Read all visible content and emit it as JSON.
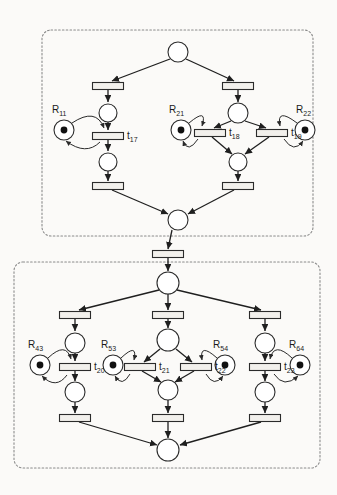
{
  "diagram": {
    "type": "petri-net",
    "title": "",
    "canvas": {
      "width": 337,
      "height": 495
    },
    "colors": {
      "background": "#fbfaf8",
      "stroke": "#1f1f1f",
      "place_fill": "#ffffff",
      "transition_fill": "#f2f0ec",
      "token": "#111111",
      "box_border": "#8a8a8a"
    },
    "subnets": [
      {
        "id": "subnet-top",
        "border_style": "dashed",
        "x": 42,
        "y": 30,
        "width": 271,
        "height": 206
      },
      {
        "id": "subnet-bottom",
        "border_style": "dashed",
        "x": 14,
        "y": 262,
        "width": 306,
        "height": 206
      }
    ],
    "places": [
      {
        "id": "p-top-source",
        "cx": 178,
        "cy": 52,
        "r": 10,
        "tokens": 0,
        "label": ""
      },
      {
        "id": "p-top-left-a",
        "cx": 108,
        "cy": 113,
        "r": 9,
        "tokens": 0,
        "label": ""
      },
      {
        "id": "p-top-left-b",
        "cx": 108,
        "cy": 162,
        "r": 9,
        "tokens": 0,
        "label": ""
      },
      {
        "id": "p-top-mid-a",
        "cx": 238,
        "cy": 113,
        "r": 10,
        "tokens": 0,
        "label": ""
      },
      {
        "id": "p-top-mid-b",
        "cx": 238,
        "cy": 162,
        "r": 9,
        "tokens": 0,
        "label": ""
      },
      {
        "id": "p-top-sink",
        "cx": 178,
        "cy": 220,
        "r": 10,
        "tokens": 0,
        "label": ""
      },
      {
        "id": "p-res-R11",
        "cx": 64,
        "cy": 130,
        "r": 10,
        "tokens": 1,
        "label": "R11"
      },
      {
        "id": "p-res-R21",
        "cx": 181,
        "cy": 130,
        "r": 10,
        "tokens": 1,
        "label": "R21"
      },
      {
        "id": "p-res-R22",
        "cx": 305,
        "cy": 130,
        "r": 10,
        "tokens": 1,
        "label": "R22"
      },
      {
        "id": "p-bot-source",
        "cx": 168,
        "cy": 283,
        "r": 11,
        "tokens": 0,
        "label": ""
      },
      {
        "id": "p-bot-left-a",
        "cx": 75,
        "cy": 343,
        "r": 10,
        "tokens": 0,
        "label": ""
      },
      {
        "id": "p-bot-left-b",
        "cx": 75,
        "cy": 392,
        "r": 10,
        "tokens": 0,
        "label": ""
      },
      {
        "id": "p-bot-mid-a",
        "cx": 168,
        "cy": 340,
        "r": 11,
        "tokens": 0,
        "label": ""
      },
      {
        "id": "p-bot-mid-b",
        "cx": 168,
        "cy": 390,
        "r": 10,
        "tokens": 0,
        "label": ""
      },
      {
        "id": "p-bot-right-a",
        "cx": 265,
        "cy": 343,
        "r": 10,
        "tokens": 0,
        "label": ""
      },
      {
        "id": "p-bot-right-b",
        "cx": 265,
        "cy": 392,
        "r": 10,
        "tokens": 0,
        "label": ""
      },
      {
        "id": "p-bot-sink",
        "cx": 168,
        "cy": 450,
        "r": 11,
        "tokens": 0,
        "label": ""
      },
      {
        "id": "p-res-R43",
        "cx": 40,
        "cy": 365,
        "r": 10,
        "tokens": 1,
        "label": "R43"
      },
      {
        "id": "p-res-R53",
        "cx": 113,
        "cy": 365,
        "r": 10,
        "tokens": 1,
        "label": "R53"
      },
      {
        "id": "p-res-R54",
        "cx": 225,
        "cy": 365,
        "r": 10,
        "tokens": 1,
        "label": "R54"
      },
      {
        "id": "p-res-R64",
        "cx": 300,
        "cy": 365,
        "r": 10,
        "tokens": 1,
        "label": "R64"
      }
    ],
    "transitions": [
      {
        "id": "t-top-l1",
        "cx": 108,
        "cy": 86,
        "w": 31,
        "h": 7,
        "label": ""
      },
      {
        "id": "t17",
        "cx": 108,
        "cy": 136,
        "w": 31,
        "h": 7,
        "label": "t17"
      },
      {
        "id": "t-top-l2",
        "cx": 108,
        "cy": 186,
        "w": 31,
        "h": 7,
        "label": ""
      },
      {
        "id": "t-top-r1",
        "cx": 238,
        "cy": 86,
        "w": 31,
        "h": 7,
        "label": ""
      },
      {
        "id": "t18",
        "cx": 210,
        "cy": 133,
        "w": 31,
        "h": 7,
        "label": "t18"
      },
      {
        "id": "t19",
        "cx": 272,
        "cy": 133,
        "w": 31,
        "h": 7,
        "label": "t19"
      },
      {
        "id": "t-top-r2",
        "cx": 238,
        "cy": 186,
        "w": 31,
        "h": 7,
        "label": ""
      },
      {
        "id": "t-link",
        "cx": 168,
        "cy": 254,
        "w": 31,
        "h": 7,
        "label": ""
      },
      {
        "id": "t-bot-l1",
        "cx": 75,
        "cy": 315,
        "w": 31,
        "h": 7,
        "label": ""
      },
      {
        "id": "t20",
        "cx": 75,
        "cy": 367,
        "w": 31,
        "h": 7,
        "label": "t20"
      },
      {
        "id": "t-bot-l2",
        "cx": 75,
        "cy": 418,
        "w": 31,
        "h": 7,
        "label": ""
      },
      {
        "id": "t-bot-m1",
        "cx": 168,
        "cy": 315,
        "w": 31,
        "h": 7,
        "label": ""
      },
      {
        "id": "t21",
        "cx": 140,
        "cy": 367,
        "w": 31,
        "h": 7,
        "label": "t21"
      },
      {
        "id": "t22",
        "cx": 196,
        "cy": 367,
        "w": 31,
        "h": 7,
        "label": "t22"
      },
      {
        "id": "t-bot-m2",
        "cx": 168,
        "cy": 418,
        "w": 31,
        "h": 7,
        "label": ""
      },
      {
        "id": "t-bot-r1",
        "cx": 265,
        "cy": 315,
        "w": 31,
        "h": 7,
        "label": ""
      },
      {
        "id": "t23",
        "cx": 265,
        "cy": 367,
        "w": 31,
        "h": 7,
        "label": "t23"
      },
      {
        "id": "t-bot-r2",
        "cx": 265,
        "cy": 418,
        "w": 31,
        "h": 7,
        "label": ""
      }
    ],
    "labels": [
      {
        "id": "label-R11",
        "base": "R",
        "sub": "11",
        "x": 52,
        "y": 113
      },
      {
        "id": "label-R21",
        "base": "R",
        "sub": "21",
        "x": 169,
        "y": 113
      },
      {
        "id": "label-R22",
        "base": "R",
        "sub": "22",
        "x": 296,
        "y": 113
      },
      {
        "id": "label-t17",
        "base": "t",
        "sub": "17",
        "x": 127,
        "y": 139
      },
      {
        "id": "label-t18",
        "base": "t",
        "sub": "18",
        "x": 229,
        "y": 136
      },
      {
        "id": "label-t19",
        "base": "t",
        "sub": "19",
        "x": 291,
        "y": 136
      },
      {
        "id": "label-R43",
        "base": "R",
        "sub": "43",
        "x": 28,
        "y": 348
      },
      {
        "id": "label-R53",
        "base": "R",
        "sub": "53",
        "x": 101,
        "y": 348
      },
      {
        "id": "label-R54",
        "base": "R",
        "sub": "54",
        "x": 213,
        "y": 348
      },
      {
        "id": "label-R64",
        "base": "R",
        "sub": "64",
        "x": 289,
        "y": 348
      },
      {
        "id": "label-t20",
        "base": "t",
        "sub": "20",
        "x": 94,
        "y": 370
      },
      {
        "id": "label-t21",
        "base": "t",
        "sub": "21",
        "x": 159,
        "y": 370
      },
      {
        "id": "label-t22",
        "base": "t",
        "sub": "22",
        "x": 215,
        "y": 370
      },
      {
        "id": "label-t23",
        "base": "t",
        "sub": "23",
        "x": 284,
        "y": 370
      }
    ],
    "arcs": [
      {
        "id": "arc-src-to-tl1",
        "from": "p-top-source",
        "to": "t-top-l1",
        "path": "M 170 59 L 112 81"
      },
      {
        "id": "arc-src-to-tr1",
        "from": "p-top-source",
        "to": "t-top-r1",
        "path": "M 186 59 L 234 81"
      },
      {
        "id": "arc-tl1-to-pla",
        "from": "t-top-l1",
        "to": "p-top-left-a",
        "path": "M 108 90 L 108 102"
      },
      {
        "id": "arc-pla-to-t17",
        "from": "p-top-left-a",
        "to": "t17",
        "path": "M 108 122 L 108 130"
      },
      {
        "id": "arc-t17-to-plb",
        "from": "t17",
        "to": "p-top-left-b",
        "path": "M 108 140 L 108 151"
      },
      {
        "id": "arc-plb-to-tl2",
        "from": "p-top-left-b",
        "to": "t-top-l2",
        "path": "M 108 171 L 108 181"
      },
      {
        "id": "arc-tl2-to-sink",
        "from": "t-top-l2",
        "to": "p-top-sink",
        "path": "M 112 190 L 168 214"
      },
      {
        "id": "arc-tr1-to-pma",
        "from": "t-top-r1",
        "to": "p-top-mid-a",
        "path": "M 238 90 L 238 102"
      },
      {
        "id": "arc-pma-to-t18",
        "from": "p-top-mid-a",
        "to": "t18",
        "path": "M 231 121 L 214 128"
      },
      {
        "id": "arc-pma-to-t19",
        "from": "p-top-mid-a",
        "to": "t19",
        "path": "M 245 121 L 266 128"
      },
      {
        "id": "arc-t18-to-pmb",
        "from": "t18",
        "to": "p-top-mid-b",
        "path": "M 212 137 L 232 154"
      },
      {
        "id": "arc-t19-to-pmb",
        "from": "t19",
        "to": "p-top-mid-b",
        "path": "M 269 137 L 245 154"
      },
      {
        "id": "arc-pmb-to-tr2",
        "from": "p-top-mid-b",
        "to": "t-top-r2",
        "path": "M 238 171 L 238 181"
      },
      {
        "id": "arc-tr2-to-sink",
        "from": "t-top-r2",
        "to": "p-top-sink",
        "path": "M 234 190 L 188 214"
      },
      {
        "id": "arc-sink-to-link",
        "from": "p-top-sink",
        "to": "t-link",
        "path": "M 172 230 L 168 249"
      },
      {
        "id": "arc-link-to-bsrc",
        "from": "t-link",
        "to": "p-bot-source",
        "path": "M 168 258 L 168 271"
      },
      {
        "id": "arc-bsrc-to-bl1",
        "from": "p-bot-source",
        "to": "t-bot-l1",
        "path": "M 159 290 L 79 310"
      },
      {
        "id": "arc-bsrc-to-bm1",
        "from": "p-bot-source",
        "to": "t-bot-m1",
        "path": "M 168 294 L 168 310"
      },
      {
        "id": "arc-bsrc-to-br1",
        "from": "p-bot-source",
        "to": "t-bot-r1",
        "path": "M 177 290 L 261 310"
      },
      {
        "id": "arc-bl1-to-pla",
        "from": "t-bot-l1",
        "to": "p-bot-left-a",
        "path": "M 75 319 L 75 331"
      },
      {
        "id": "arc-bpla-to-t20",
        "from": "p-bot-left-a",
        "to": "t20",
        "path": "M 75 353 L 75 361"
      },
      {
        "id": "arc-t20-to-bplb",
        "from": "t20",
        "to": "p-bot-left-b",
        "path": "M 75 371 L 75 381"
      },
      {
        "id": "arc-bplb-to-bl2",
        "from": "p-bot-left-b",
        "to": "t-bot-l2",
        "path": "M 75 402 L 75 413"
      },
      {
        "id": "arc-bl2-to-bsink",
        "from": "t-bot-l2",
        "to": "p-bot-sink",
        "path": "M 79 422 L 157 445"
      },
      {
        "id": "arc-bm1-to-pma",
        "from": "t-bot-m1",
        "to": "p-bot-mid-a",
        "path": "M 168 319 L 168 328"
      },
      {
        "id": "arc-bpma-to-t21",
        "from": "p-bot-mid-a",
        "to": "t21",
        "path": "M 160 349 L 144 362"
      },
      {
        "id": "arc-bpma-to-t22",
        "from": "p-bot-mid-a",
        "to": "t22",
        "path": "M 176 349 L 192 362"
      },
      {
        "id": "arc-t21-to-bpmb",
        "from": "t21",
        "to": "p-bot-mid-b",
        "path": "M 142 371 L 161 382"
      },
      {
        "id": "arc-t22-to-bpmb",
        "from": "t22",
        "to": "p-bot-mid-b",
        "path": "M 194 371 L 175 382"
      },
      {
        "id": "arc-bpmb-to-bm2",
        "from": "p-bot-mid-b",
        "to": "t-bot-m2",
        "path": "M 168 400 L 168 413"
      },
      {
        "id": "arc-bm2-to-bsink",
        "from": "t-bot-m2",
        "to": "p-bot-sink",
        "path": "M 168 422 L 168 438"
      },
      {
        "id": "arc-br1-to-pra",
        "from": "t-bot-r1",
        "to": "p-bot-right-a",
        "path": "M 265 319 L 265 331"
      },
      {
        "id": "arc-bpra-to-t23",
        "from": "p-bot-right-a",
        "to": "t23",
        "path": "M 265 353 L 265 361"
      },
      {
        "id": "arc-t23-to-bprb",
        "from": "t23",
        "to": "p-bot-right-b",
        "path": "M 265 371 L 265 381"
      },
      {
        "id": "arc-bprb-to-br2",
        "from": "p-bot-right-b",
        "to": "t-bot-r2",
        "path": "M 265 402 L 265 413"
      },
      {
        "id": "arc-br2-to-bsink",
        "from": "t-bot-r2",
        "to": "p-bot-sink",
        "path": "M 261 422 L 180 445"
      }
    ],
    "resource_arcs": [
      {
        "id": "rarc-R11-out",
        "place": "p-res-R11",
        "trans": "t17",
        "path": "M 72 123 Q 96 107 104 128"
      },
      {
        "id": "rarc-R11-in",
        "place": "t17",
        "trans": "p-res-R11",
        "path": "M 100 142 Q 86 156 66 141"
      },
      {
        "id": "rarc-R21-out",
        "place": "p-res-R21",
        "trans": "t18",
        "path": "M 189 123 Q 208 107 202 126"
      },
      {
        "id": "rarc-R21-in",
        "place": "t18",
        "trans": "p-res-R21",
        "path": "M 198 139 Q 188 154 183 141"
      },
      {
        "id": "rarc-R22-out",
        "place": "p-res-R22",
        "trans": "t19",
        "path": "M 297 123 Q 276 107 280 126"
      },
      {
        "id": "rarc-R22-in",
        "place": "t19",
        "trans": "p-res-R22",
        "path": "M 284 139 Q 294 154 303 141"
      },
      {
        "id": "rarc-R43-out",
        "place": "p-res-R43",
        "trans": "t20",
        "path": "M 48 358 Q 66 341 71 359"
      },
      {
        "id": "rarc-R43-in",
        "place": "t20",
        "trans": "p-res-R43",
        "path": "M 67 375 Q 56 390 42 376"
      },
      {
        "id": "rarc-R53-out",
        "place": "p-res-R53",
        "trans": "t21",
        "path": "M 121 358 Q 138 342 134 360"
      },
      {
        "id": "rarc-R53-in",
        "place": "t21",
        "trans": "p-res-R53",
        "path": "M 130 374 Q 122 388 115 376"
      },
      {
        "id": "rarc-R54-out",
        "place": "p-res-R54",
        "trans": "t22",
        "path": "M 217 358 Q 199 342 202 360"
      },
      {
        "id": "rarc-R54-in",
        "place": "t22",
        "trans": "p-res-R54",
        "path": "M 206 374 Q 214 388 223 376"
      },
      {
        "id": "rarc-R64-out",
        "place": "p-res-R64",
        "trans": "t23",
        "path": "M 292 358 Q 274 341 270 359"
      },
      {
        "id": "rarc-R64-in",
        "place": "t23",
        "trans": "p-res-R64",
        "path": "M 274 374 Q 284 389 298 376"
      }
    ]
  }
}
